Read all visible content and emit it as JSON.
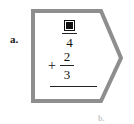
{
  "page": {
    "item_label": "a.",
    "next_item_label": "b."
  },
  "colors": {
    "shape_stroke": "#8e8e8e",
    "shape_fill": "#ffffff",
    "text": "#111111",
    "label_text": "#1a1a1a",
    "faint_text": "#c9c9c9"
  },
  "shape": {
    "name": "arrow-callout",
    "points": "33,11 101,11 121,58 101,101 33,101"
  },
  "problem": {
    "type": "fraction-addition",
    "operator": "+",
    "first_term": {
      "numerator": "",
      "numerator_is_blank": true,
      "denominator": "4"
    },
    "second_term": {
      "numerator": "2",
      "denominator": "3"
    },
    "answer": ""
  }
}
